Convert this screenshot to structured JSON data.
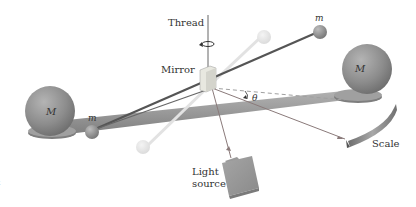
{
  "figure": {
    "labels": {
      "thread": "Thread",
      "mirror": "Mirror",
      "small_mass_left": "m",
      "small_mass_right": "m",
      "large_mass_left": "M",
      "large_mass_right": "M",
      "angle": "θ",
      "light_source_line1": "Light",
      "light_source_line2": "source",
      "scale": "Scale",
      "edge_fragment": "t"
    },
    "colors": {
      "background": "#ffffff",
      "sphere": "#8a8a8a",
      "beam": "#9a9a9a",
      "rod": "#555555",
      "light_ray": "#8a7a7a",
      "ghost": "#e6e6e6",
      "text": "#333333"
    }
  }
}
